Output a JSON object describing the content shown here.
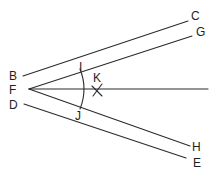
{
  "diagram": {
    "labels": {
      "B": "B",
      "C": "C",
      "D": "D",
      "E": "E",
      "F": "F",
      "G": "G",
      "H": "H",
      "I": "I",
      "J": "J",
      "K": "K"
    },
    "stroke_color": "#2a2a2a",
    "background": "#ffffff"
  }
}
